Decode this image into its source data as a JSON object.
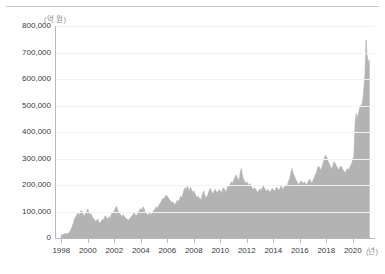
{
  "chart_data": {
    "type": "area",
    "title": "",
    "subtitle": "",
    "xlabel": "(년)",
    "ylabel": "(억 원)",
    "unit_y": "(억 원)",
    "unit_x": "(년)",
    "xlim": [
      1997.6,
      2021.6
    ],
    "ylim": [
      0,
      800000
    ],
    "grid": true,
    "legend": null,
    "series_color": "#b3b3b3",
    "axis_color": "#b9b9bd",
    "grid_color": "#f2f2f3",
    "text_color": "#3a3a3e",
    "y_ticks": [
      0,
      100000,
      200000,
      300000,
      400000,
      500000,
      600000,
      700000,
      800000
    ],
    "y_tick_labels": [
      "0",
      "100,000",
      "200,000",
      "300,000",
      "400,000",
      "500,000",
      "600,000",
      "700,000",
      "800,000"
    ],
    "x_ticks": [
      1998,
      2000,
      2002,
      2004,
      2006,
      2008,
      2010,
      2012,
      2014,
      2016,
      2018,
      2020
    ],
    "x_tick_labels": [
      "1998",
      "2000",
      "2002",
      "2004",
      "2006",
      "2008",
      "2010",
      "2012",
      "2014",
      "2016",
      "2018",
      "2020"
    ],
    "x": [
      1998.0,
      1998.08,
      1998.17,
      1998.25,
      1998.33,
      1998.42,
      1998.5,
      1998.58,
      1998.67,
      1998.75,
      1998.83,
      1998.92,
      1999.0,
      1999.08,
      1999.17,
      1999.25,
      1999.33,
      1999.42,
      1999.5,
      1999.58,
      1999.67,
      1999.75,
      1999.83,
      1999.92,
      2000.0,
      2000.08,
      2000.17,
      2000.25,
      2000.33,
      2000.42,
      2000.5,
      2000.58,
      2000.67,
      2000.75,
      2000.83,
      2000.92,
      2001.0,
      2001.08,
      2001.17,
      2001.25,
      2001.33,
      2001.42,
      2001.5,
      2001.58,
      2001.67,
      2001.75,
      2001.83,
      2001.92,
      2002.0,
      2002.08,
      2002.17,
      2002.25,
      2002.33,
      2002.42,
      2002.5,
      2002.58,
      2002.67,
      2002.75,
      2002.83,
      2002.92,
      2003.0,
      2003.08,
      2003.17,
      2003.25,
      2003.33,
      2003.42,
      2003.5,
      2003.58,
      2003.67,
      2003.75,
      2003.83,
      2003.92,
      2004.0,
      2004.08,
      2004.17,
      2004.25,
      2004.33,
      2004.42,
      2004.5,
      2004.58,
      2004.67,
      2004.75,
      2004.83,
      2004.92,
      2005.0,
      2005.08,
      2005.17,
      2005.25,
      2005.33,
      2005.42,
      2005.5,
      2005.58,
      2005.67,
      2005.75,
      2005.83,
      2005.92,
      2006.0,
      2006.08,
      2006.17,
      2006.25,
      2006.33,
      2006.42,
      2006.5,
      2006.58,
      2006.67,
      2006.75,
      2006.83,
      2006.92,
      2007.0,
      2007.08,
      2007.17,
      2007.25,
      2007.33,
      2007.42,
      2007.5,
      2007.58,
      2007.67,
      2007.75,
      2007.83,
      2007.92,
      2008.0,
      2008.08,
      2008.17,
      2008.25,
      2008.33,
      2008.42,
      2008.5,
      2008.58,
      2008.67,
      2008.75,
      2008.83,
      2008.92,
      2009.0,
      2009.08,
      2009.17,
      2009.25,
      2009.33,
      2009.42,
      2009.5,
      2009.58,
      2009.67,
      2009.75,
      2009.83,
      2009.92,
      2010.0,
      2010.08,
      2010.17,
      2010.25,
      2010.33,
      2010.42,
      2010.5,
      2010.58,
      2010.67,
      2010.75,
      2010.83,
      2010.92,
      2011.0,
      2011.08,
      2011.17,
      2011.25,
      2011.33,
      2011.42,
      2011.5,
      2011.58,
      2011.67,
      2011.75,
      2011.83,
      2011.92,
      2012.0,
      2012.08,
      2012.17,
      2012.25,
      2012.33,
      2012.42,
      2012.5,
      2012.58,
      2012.67,
      2012.75,
      2012.83,
      2012.92,
      2013.0,
      2013.08,
      2013.17,
      2013.25,
      2013.33,
      2013.42,
      2013.5,
      2013.58,
      2013.67,
      2013.75,
      2013.83,
      2013.92,
      2014.0,
      2014.08,
      2014.17,
      2014.25,
      2014.33,
      2014.42,
      2014.5,
      2014.58,
      2014.67,
      2014.75,
      2014.83,
      2014.92,
      2015.0,
      2015.08,
      2015.17,
      2015.25,
      2015.33,
      2015.42,
      2015.5,
      2015.58,
      2015.67,
      2015.75,
      2015.83,
      2015.92,
      2016.0,
      2016.08,
      2016.17,
      2016.25,
      2016.33,
      2016.42,
      2016.5,
      2016.58,
      2016.67,
      2016.75,
      2016.83,
      2016.92,
      2017.0,
      2017.08,
      2017.17,
      2017.25,
      2017.33,
      2017.42,
      2017.5,
      2017.58,
      2017.67,
      2017.75,
      2017.83,
      2017.92,
      2018.0,
      2018.08,
      2018.17,
      2018.25,
      2018.33,
      2018.42,
      2018.5,
      2018.58,
      2018.67,
      2018.75,
      2018.83,
      2018.92,
      2019.0,
      2019.08,
      2019.17,
      2019.25,
      2019.33,
      2019.42,
      2019.5,
      2019.58,
      2019.67,
      2019.75,
      2019.83,
      2019.92,
      2020.0,
      2020.08,
      2020.17,
      2020.25,
      2020.33,
      2020.42,
      2020.5,
      2020.58,
      2020.67,
      2020.75,
      2020.83,
      2020.92,
      2021.0,
      2021.08,
      2021.17,
      2021.25
    ],
    "values": [
      12000,
      11000,
      14000,
      16000,
      18000,
      15000,
      17000,
      20000,
      26000,
      34000,
      45000,
      58000,
      72000,
      80000,
      88000,
      95000,
      86000,
      92000,
      105000,
      98000,
      88000,
      84000,
      92000,
      100000,
      110000,
      96000,
      88000,
      92000,
      80000,
      74000,
      70000,
      62000,
      66000,
      72000,
      60000,
      58000,
      62000,
      70000,
      66000,
      78000,
      84000,
      76000,
      70000,
      80000,
      74000,
      86000,
      95000,
      92000,
      104000,
      112000,
      120000,
      108000,
      96000,
      92000,
      86000,
      80000,
      88000,
      82000,
      76000,
      72000,
      70000,
      68000,
      74000,
      78000,
      84000,
      90000,
      96000,
      88000,
      84000,
      92000,
      100000,
      106000,
      112000,
      104000,
      118000,
      110000,
      98000,
      92000,
      86000,
      90000,
      96000,
      88000,
      92000,
      100000,
      104000,
      110000,
      118000,
      112000,
      120000,
      128000,
      134000,
      142000,
      150000,
      146000,
      156000,
      162000,
      158000,
      150000,
      146000,
      140000,
      132000,
      138000,
      130000,
      126000,
      134000,
      142000,
      138000,
      146000,
      158000,
      150000,
      166000,
      178000,
      190000,
      182000,
      196000,
      188000,
      176000,
      192000,
      182000,
      170000,
      178000,
      168000,
      160000,
      152000,
      158000,
      150000,
      144000,
      152000,
      168000,
      178000,
      162000,
      150000,
      158000,
      166000,
      180000,
      188000,
      176000,
      168000,
      172000,
      184000,
      178000,
      170000,
      176000,
      182000,
      178000,
      170000,
      184000,
      190000,
      182000,
      174000,
      186000,
      196000,
      192000,
      204000,
      212000,
      206000,
      218000,
      226000,
      238000,
      232000,
      224000,
      216000,
      246000,
      262000,
      236000,
      222000,
      214000,
      206000,
      212000,
      204000,
      198000,
      206000,
      196000,
      188000,
      182000,
      190000,
      184000,
      178000,
      172000,
      180000,
      186000,
      178000,
      190000,
      196000,
      188000,
      182000,
      176000,
      184000,
      178000,
      172000,
      180000,
      188000,
      182000,
      176000,
      184000,
      192000,
      186000,
      180000,
      188000,
      196000,
      190000,
      184000,
      192000,
      200000,
      196000,
      204000,
      216000,
      228000,
      248000,
      262000,
      242000,
      236000,
      224000,
      216000,
      208000,
      202000,
      208000,
      216000,
      210000,
      204000,
      212000,
      206000,
      200000,
      208000,
      216000,
      222000,
      214000,
      208000,
      218000,
      226000,
      238000,
      246000,
      262000,
      272000,
      264000,
      256000,
      268000,
      282000,
      296000,
      312000,
      306000,
      298000,
      286000,
      278000,
      268000,
      260000,
      274000,
      288000,
      282000,
      274000,
      266000,
      258000,
      264000,
      272000,
      266000,
      258000,
      252000,
      246000,
      254000,
      262000,
      256000,
      264000,
      272000,
      282000,
      296000,
      310000,
      430000,
      470000,
      452000,
      468000,
      486000,
      502000,
      498000,
      520000,
      560000,
      620000,
      748000,
      690000,
      660000,
      672000
    ],
    "peak": {
      "value": 748000,
      "year": 2021.0
    }
  }
}
